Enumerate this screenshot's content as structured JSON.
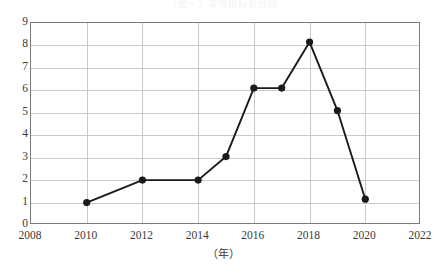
{
  "top_caption": "（图一）某项指标折线图",
  "chart_data": {
    "type": "line",
    "title": "",
    "subtitle": "",
    "xlabel": "（年）",
    "ylabel": "",
    "xlim": [
      2008,
      2022
    ],
    "ylim": [
      0,
      9
    ],
    "grid": true,
    "legend": false,
    "legend_position": "none",
    "x_ticks": [
      "2008",
      "2010",
      "2012",
      "2014",
      "2016",
      "2018",
      "2020",
      "2022"
    ],
    "x_tick_values": [
      2008,
      2010,
      2012,
      2014,
      2016,
      2018,
      2020,
      2022
    ],
    "y_ticks": [
      "0",
      "1",
      "2",
      "3",
      "4",
      "5",
      "6",
      "7",
      "8",
      "9"
    ],
    "y_tick_values": [
      0,
      1,
      2,
      3,
      4,
      5,
      6,
      7,
      8,
      9
    ],
    "series": [
      {
        "name": "series-1",
        "color": "#1a1a1a",
        "marker": "circle",
        "x": [
          2010,
          2012,
          2014,
          2015,
          2016,
          2017,
          2018,
          2019,
          2020
        ],
        "values": [
          1.0,
          2.0,
          2.0,
          3.05,
          6.1,
          6.1,
          8.15,
          5.1,
          1.15
        ]
      }
    ]
  },
  "style": {
    "grid_color": "#c9c9c9",
    "axis_color": "#7a7a7a",
    "line_color": "#1a1a1a",
    "text_color": "#3a3a3a",
    "background": "#ffffff"
  }
}
